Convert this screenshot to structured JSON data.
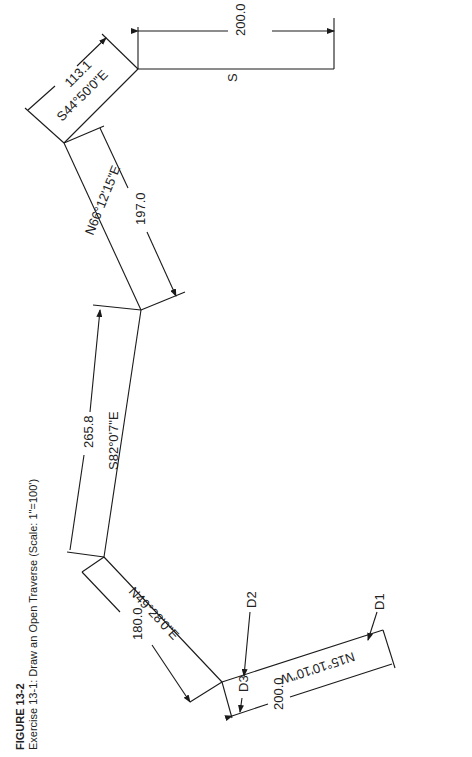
{
  "figure": {
    "number": "FIGURE 13-2",
    "caption": "Exercise 13-1: Draw an Open Traverse (Scale: 1\"=100')"
  },
  "courses": [
    {
      "bearing": "N15°10'10\"W",
      "distance": "200.0"
    },
    {
      "bearing": "N49°28'0\"E",
      "distance": "180.0"
    },
    {
      "bearing": "S82°0'7\"E",
      "distance": "265.8"
    },
    {
      "bearing": "N66°12'15\"E",
      "distance": "197.0"
    },
    {
      "bearing": "S44°50'0\"E",
      "distance": "113.1"
    },
    {
      "bearing": "S",
      "distance": "200.0"
    }
  ],
  "callouts": {
    "d1": "D1",
    "d2": "D2",
    "d3": "D3"
  }
}
